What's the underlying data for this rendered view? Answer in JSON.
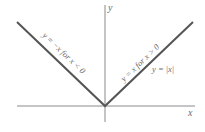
{
  "figure": {
    "axes": {
      "x_label": "x",
      "y_label": "y",
      "origin": [
        105,
        106
      ],
      "axis_color": "#8a8a8a"
    },
    "curve": {
      "name": "y = |x|",
      "color": "#555555",
      "left_branch_label": "y = −x  for  x < 0",
      "right_branch_label": "y = x  for  x > 0",
      "function_label": "y = |x|"
    }
  }
}
